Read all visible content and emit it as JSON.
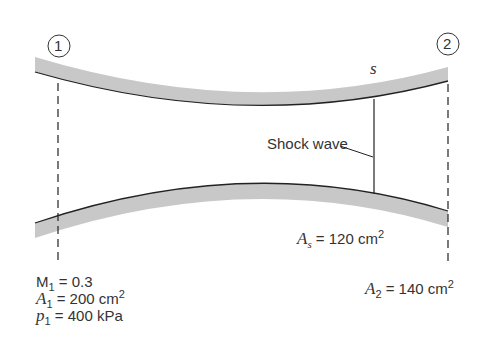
{
  "diagram": {
    "type": "converging-diverging nozzle with normal shock",
    "stations": [
      {
        "id": "station-1",
        "marker": "1"
      },
      {
        "id": "station-2",
        "marker": "2"
      }
    ],
    "shock": {
      "marker": "s",
      "label": "Shock wave"
    },
    "station1_conditions": {
      "mach": {
        "symbol": "M",
        "sub": "1",
        "value": "= 0.3"
      },
      "area": {
        "symbol": "A",
        "sub": "1",
        "value": "= 200 cm",
        "sup": "2"
      },
      "pressure": {
        "symbol": "p",
        "sub": "1",
        "value": "= 400 kPa"
      }
    },
    "shock_area": {
      "symbol": "A",
      "sub": "s",
      "value": "= 120 cm",
      "sup": "2"
    },
    "station2_area": {
      "symbol": "A",
      "sub": "2",
      "value": "= 140 cm",
      "sup": "2"
    },
    "colors": {
      "wall": "#c8c8c8",
      "line": "#222222",
      "text": "#333333"
    }
  }
}
